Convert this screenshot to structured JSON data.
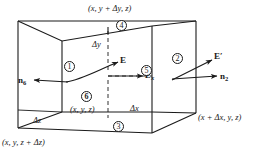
{
  "figure": {
    "background": "#ffffff",
    "line_color": "#1a1a1a",
    "width": 259,
    "height": 160
  },
  "coordinate_labels": {
    "top": "(x, y + Δy, z)",
    "origin": "(x, y, z)",
    "bottom_left": "(x, y, z + Δz)",
    "bottom_right": "(x + Δx, y, z)"
  },
  "dimension_labels": {
    "dy": "Δy",
    "dx": "Δx",
    "dz": "Δz"
  },
  "vector_labels": {
    "e_left": "E",
    "e_right": "E′",
    "n6": "n",
    "n6_sub": "6",
    "n2": "n",
    "n2_sub": "2",
    "ex": "E",
    "ex_sub": "x"
  },
  "face_numbers": {
    "one": "①",
    "two": "②",
    "three": "③",
    "four": "④",
    "five": "⑤",
    "six": "⑥",
    "one_text": "1",
    "two_text": "2",
    "three_text": "3",
    "four_text": "4",
    "five_text": "5",
    "six_text": "6"
  }
}
